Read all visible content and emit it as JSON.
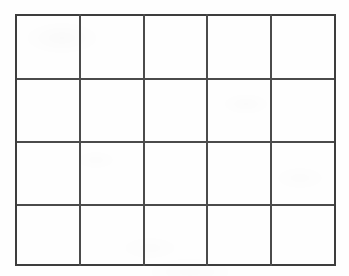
{
  "document": {
    "kind": "blank-grid-worksheet",
    "title": "Blank Grid",
    "description": "Hand-ruled empty table, 5 columns by 4 rows, on white scanned paper",
    "paper_color": "#fefefe",
    "line_color": "#3d3d3d"
  },
  "grid": {
    "columns": 5,
    "rows": 4,
    "cell_count": 20,
    "bounds": {
      "left": 15,
      "top": 14,
      "right": 335,
      "bottom": 266
    },
    "vertical_line_positions": [
      15,
      80,
      144,
      207,
      271,
      335
    ],
    "horizontal_line_positions": [
      14,
      79,
      142,
      205,
      266
    ],
    "column_widths": [
      65,
      64,
      63,
      64,
      64
    ],
    "row_heights": [
      65,
      63,
      63,
      61
    ],
    "line_thickness_px": 2,
    "cells": [
      {
        "row": 1,
        "col": 1,
        "text": ""
      },
      {
        "row": 1,
        "col": 2,
        "text": ""
      },
      {
        "row": 1,
        "col": 3,
        "text": ""
      },
      {
        "row": 1,
        "col": 4,
        "text": ""
      },
      {
        "row": 1,
        "col": 5,
        "text": ""
      },
      {
        "row": 2,
        "col": 1,
        "text": ""
      },
      {
        "row": 2,
        "col": 2,
        "text": ""
      },
      {
        "row": 2,
        "col": 3,
        "text": ""
      },
      {
        "row": 2,
        "col": 4,
        "text": ""
      },
      {
        "row": 2,
        "col": 5,
        "text": ""
      },
      {
        "row": 3,
        "col": 1,
        "text": ""
      },
      {
        "row": 3,
        "col": 2,
        "text": ""
      },
      {
        "row": 3,
        "col": 3,
        "text": ""
      },
      {
        "row": 3,
        "col": 4,
        "text": ""
      },
      {
        "row": 3,
        "col": 5,
        "text": ""
      },
      {
        "row": 4,
        "col": 1,
        "text": ""
      },
      {
        "row": 4,
        "col": 2,
        "text": ""
      },
      {
        "row": 4,
        "col": 3,
        "text": ""
      },
      {
        "row": 4,
        "col": 4,
        "text": ""
      },
      {
        "row": 4,
        "col": 5,
        "text": ""
      }
    ]
  }
}
